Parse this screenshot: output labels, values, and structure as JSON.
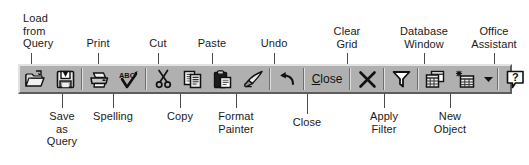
{
  "toolbar": {
    "name": "Access Query Design toolbar",
    "background": "#b0b0b0",
    "buttons": [
      {
        "id": "load-from-query",
        "icon": "open-folder-query-icon",
        "label": "Load from Query"
      },
      {
        "id": "save-as-query",
        "icon": "floppy-disk-save-query-icon",
        "label": "Save as Query"
      },
      {
        "id": "print",
        "icon": "printer-icon",
        "label": "Print"
      },
      {
        "id": "spelling",
        "icon": "spelling-abc-check-icon",
        "label": "Spelling"
      },
      {
        "id": "cut",
        "icon": "scissors-icon",
        "label": "Cut"
      },
      {
        "id": "copy",
        "icon": "copy-documents-icon",
        "label": "Copy"
      },
      {
        "id": "paste",
        "icon": "clipboard-paste-icon",
        "label": "Paste"
      },
      {
        "id": "format-painter",
        "icon": "paintbrush-icon",
        "label": "Format Painter"
      },
      {
        "id": "undo",
        "icon": "undo-arrow-icon",
        "label": "Undo"
      },
      {
        "id": "close",
        "icon": "text-button",
        "label": "Close",
        "text": "Close",
        "accesskey": "C"
      },
      {
        "id": "clear-grid",
        "icon": "x-cross-icon",
        "label": "Clear Grid"
      },
      {
        "id": "apply-filter",
        "icon": "funnel-filter-icon",
        "label": "Apply Filter"
      },
      {
        "id": "database-window",
        "icon": "database-window-icon",
        "label": "Database Window"
      },
      {
        "id": "new-object",
        "icon": "new-object-icon",
        "label": "New Object"
      },
      {
        "id": "new-object-dropdown",
        "icon": "chevron-down-icon",
        "label": "New Object dropdown"
      },
      {
        "id": "office-assistant",
        "icon": "question-mark-balloon-icon",
        "label": "Office Assistant"
      }
    ]
  },
  "callouts_top": [
    {
      "id": "load-from-query",
      "text": "Load\nfrom\nQuery"
    },
    {
      "id": "print",
      "text": "Print"
    },
    {
      "id": "cut",
      "text": "Cut"
    },
    {
      "id": "paste",
      "text": "Paste"
    },
    {
      "id": "undo",
      "text": "Undo"
    },
    {
      "id": "clear-grid",
      "text": "Clear\nGrid"
    },
    {
      "id": "database-window",
      "text": "Database\nWindow"
    },
    {
      "id": "office-assistant",
      "text": "Office\nAssistant"
    }
  ],
  "callouts_bottom": [
    {
      "id": "save-as-query",
      "text": "Save\nas\nQuery"
    },
    {
      "id": "spelling",
      "text": "Spelling"
    },
    {
      "id": "copy",
      "text": "Copy"
    },
    {
      "id": "format-painter",
      "text": "Format\nPainter"
    },
    {
      "id": "close",
      "text": "Close"
    },
    {
      "id": "apply-filter",
      "text": "Apply\nFilter"
    },
    {
      "id": "new-object",
      "text": "New\nObject"
    }
  ]
}
